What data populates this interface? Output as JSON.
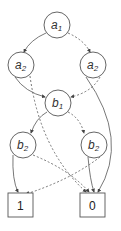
{
  "diagram": {
    "type": "binary-decision-diagram",
    "nodes": [
      {
        "id": "a1",
        "var": "a",
        "sub": "1",
        "cx": 57,
        "cy": 25
      },
      {
        "id": "a2L",
        "var": "a",
        "sub": "2",
        "cx": 21,
        "cy": 65
      },
      {
        "id": "a2R",
        "var": "a",
        "sub": "2",
        "cx": 93,
        "cy": 65
      },
      {
        "id": "b1",
        "var": "b",
        "sub": "1",
        "cx": 58,
        "cy": 103
      },
      {
        "id": "b2L",
        "var": "b",
        "sub": "2",
        "cx": 23,
        "cy": 145
      },
      {
        "id": "b2R",
        "var": "b",
        "sub": "2",
        "cx": 94,
        "cy": 145
      }
    ],
    "terminals": [
      {
        "id": "t1",
        "label": "1",
        "x": 8,
        "y": 193
      },
      {
        "id": "t0",
        "label": "0",
        "x": 80,
        "y": 193
      }
    ],
    "edges": [
      {
        "from": "a1",
        "to": "a2L",
        "style": "solid"
      },
      {
        "from": "a1",
        "to": "a2R",
        "style": "dashed"
      },
      {
        "from": "a2L",
        "to": "b1",
        "style": "solid"
      },
      {
        "from": "a2L",
        "to": "t0",
        "style": "dashed"
      },
      {
        "from": "a2R",
        "to": "b1",
        "style": "dashed"
      },
      {
        "from": "a2R",
        "to": "t0",
        "style": "solid"
      },
      {
        "from": "b1",
        "to": "b2L",
        "style": "solid"
      },
      {
        "from": "b1",
        "to": "b2R",
        "style": "dashed"
      },
      {
        "from": "b2L",
        "to": "t1",
        "style": "solid"
      },
      {
        "from": "b2L",
        "to": "t0",
        "style": "dashed"
      },
      {
        "from": "b2R",
        "to": "t1",
        "style": "dashed"
      },
      {
        "from": "b2R",
        "to": "t0",
        "style": "solid"
      }
    ],
    "colors": {
      "stroke": "#444444",
      "background": "#ffffff"
    }
  }
}
